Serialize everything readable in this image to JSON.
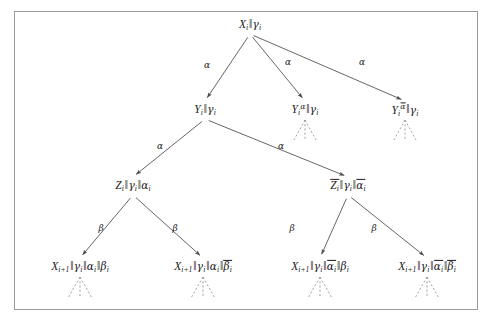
{
  "figure": {
    "kind": "binary-derivation-tree",
    "border_color": "#9a9a9a",
    "line_color": "#4a4a4a",
    "text_color": "#1a1a1a",
    "background": "#ffffff"
  },
  "nodes": {
    "root": {
      "id": "root",
      "label": "X_i || gamma_i",
      "x": 250,
      "y": 25,
      "parts": [
        {
          "t": "var",
          "v": "X",
          "sub": "i"
        },
        {
          "t": "par"
        },
        {
          "t": "greek",
          "v": "γ",
          "sub": "i"
        }
      ]
    },
    "y_plain": {
      "id": "y-plain",
      "label": "Y_i || gamma_i",
      "x": 205,
      "y": 110,
      "parts": [
        {
          "t": "var",
          "v": "Y",
          "sub": "i"
        },
        {
          "t": "par"
        },
        {
          "t": "greek",
          "v": "γ",
          "sub": "i"
        }
      ]
    },
    "y_alpha": {
      "id": "y-alpha",
      "label": "Y_i^alpha || gamma_i",
      "x": 305,
      "y": 110,
      "sup": "α",
      "sup_bar": false,
      "parts": [
        {
          "t": "var",
          "v": "Y",
          "sub": "i",
          "sup": "α"
        },
        {
          "t": "par"
        },
        {
          "t": "greek",
          "v": "γ",
          "sub": "i"
        }
      ]
    },
    "y_alpha_bar": {
      "id": "y-alpha-bar",
      "label": "Y_i^alphabar || gamma_i",
      "x": 405,
      "y": 110,
      "sup": "α",
      "sup_bar": true,
      "parts": [
        {
          "t": "var",
          "v": "Y",
          "sub": "i",
          "sup": "α",
          "sup_bar": true
        },
        {
          "t": "par"
        },
        {
          "t": "greek",
          "v": "γ",
          "sub": "i"
        }
      ]
    },
    "z_plain": {
      "id": "z-plain",
      "label": "Z_i || gamma_i || alpha_i",
      "x": 133,
      "y": 186,
      "parts": [
        {
          "t": "var",
          "v": "Z",
          "sub": "i"
        },
        {
          "t": "par"
        },
        {
          "t": "greek",
          "v": "γ",
          "sub": "i"
        },
        {
          "t": "par"
        },
        {
          "t": "greek",
          "v": "α",
          "sub": "i"
        }
      ]
    },
    "z_bar": {
      "id": "z-bar",
      "label": "Zbar_i || gamma_i || alphabar_i",
      "x": 348,
      "y": 186,
      "parts": [
        {
          "t": "var",
          "v": "Z",
          "sub": "i",
          "bar": true
        },
        {
          "t": "par"
        },
        {
          "t": "greek",
          "v": "γ",
          "sub": "i"
        },
        {
          "t": "par"
        },
        {
          "t": "greek",
          "v": "α",
          "sub": "i",
          "bar": true
        }
      ]
    },
    "leaf1": {
      "id": "leaf-aa-bb",
      "label": "X_{i+1} || gamma_i || alpha_i || beta_i",
      "x": 80,
      "y": 267,
      "parts": [
        {
          "t": "var",
          "v": "X",
          "sub": "i+1"
        },
        {
          "t": "par"
        },
        {
          "t": "greek",
          "v": "γ",
          "sub": "i"
        },
        {
          "t": "par"
        },
        {
          "t": "greek",
          "v": "α",
          "sub": "i"
        },
        {
          "t": "par"
        },
        {
          "t": "greek",
          "v": "β",
          "sub": "i"
        }
      ]
    },
    "leaf2": {
      "id": "leaf-aa-bbbar",
      "label": "X_{i+1} || gamma_i || alpha_i || betabar_i",
      "x": 203,
      "y": 267,
      "parts": [
        {
          "t": "var",
          "v": "X",
          "sub": "i+1"
        },
        {
          "t": "par"
        },
        {
          "t": "greek",
          "v": "γ",
          "sub": "i"
        },
        {
          "t": "par"
        },
        {
          "t": "greek",
          "v": "α",
          "sub": "i"
        },
        {
          "t": "par"
        },
        {
          "t": "greek",
          "v": "β",
          "sub": "i",
          "bar": true
        }
      ]
    },
    "leaf3": {
      "id": "leaf-aabar-bb",
      "label": "X_{i+1} || gamma_i || alphabar_i || beta_i",
      "x": 320,
      "y": 267,
      "parts": [
        {
          "t": "var",
          "v": "X",
          "sub": "i+1"
        },
        {
          "t": "par"
        },
        {
          "t": "greek",
          "v": "γ",
          "sub": "i"
        },
        {
          "t": "par"
        },
        {
          "t": "greek",
          "v": "α",
          "sub": "i",
          "bar": true
        },
        {
          "t": "par"
        },
        {
          "t": "greek",
          "v": "β",
          "sub": "i"
        }
      ]
    },
    "leaf4": {
      "id": "leaf-aabar-bbbar",
      "label": "X_{i+1} || gamma_i || alphabar_i || betabar_i",
      "x": 427,
      "y": 267,
      "parts": [
        {
          "t": "var",
          "v": "X",
          "sub": "i+1"
        },
        {
          "t": "par"
        },
        {
          "t": "greek",
          "v": "γ",
          "sub": "i"
        },
        {
          "t": "par"
        },
        {
          "t": "greek",
          "v": "α",
          "sub": "i",
          "bar": true
        },
        {
          "t": "par"
        },
        {
          "t": "greek",
          "v": "β",
          "sub": "i",
          "bar": true
        }
      ]
    }
  },
  "edge_labels": [
    {
      "id": "edge-label-root-left",
      "text": "α",
      "x": 207,
      "y": 65
    },
    {
      "id": "edge-label-root-mid",
      "text": "α",
      "x": 288,
      "y": 62
    },
    {
      "id": "edge-label-root-right",
      "text": "α",
      "x": 362,
      "y": 62
    },
    {
      "id": "edge-label-y-left",
      "text": "α",
      "x": 160,
      "y": 146
    },
    {
      "id": "edge-label-y-right",
      "text": "α",
      "x": 281,
      "y": 146
    },
    {
      "id": "edge-label-z-left",
      "text": "β",
      "x": 101,
      "y": 228
    },
    {
      "id": "edge-label-z-right",
      "text": "β",
      "x": 175,
      "y": 228
    },
    {
      "id": "edge-label-zbar-left",
      "text": "β",
      "x": 292,
      "y": 228
    },
    {
      "id": "edge-label-zbar-right",
      "text": "β",
      "x": 374,
      "y": 228
    }
  ],
  "edges": [
    {
      "id": "edge-root-to-y-plain",
      "from": "root",
      "to": "y_plain",
      "style": "solid",
      "arrow": true
    },
    {
      "id": "edge-root-to-y-alpha",
      "from": "root",
      "to": "y_alpha",
      "style": "solid",
      "arrow": true
    },
    {
      "id": "edge-root-to-y-alpha-bar",
      "from": "root",
      "to": "y_alpha_bar",
      "style": "solid",
      "arrow": true
    },
    {
      "id": "edge-y-to-z-plain",
      "from": "y_plain",
      "to": "z_plain",
      "style": "solid",
      "arrow": true
    },
    {
      "id": "edge-y-to-z-bar",
      "from": "y_plain",
      "to": "z_bar",
      "style": "solid",
      "arrow": true
    },
    {
      "id": "edge-z-to-leaf1",
      "from": "z_plain",
      "to": "leaf1",
      "style": "solid",
      "arrow": true
    },
    {
      "id": "edge-z-to-leaf2",
      "from": "z_plain",
      "to": "leaf2",
      "style": "solid",
      "arrow": true
    },
    {
      "id": "edge-zbar-to-leaf3",
      "from": "z_bar",
      "to": "leaf3",
      "style": "solid",
      "arrow": true
    },
    {
      "id": "edge-zbar-to-leaf4",
      "from": "z_bar",
      "to": "leaf4",
      "style": "solid",
      "arrow": true
    }
  ],
  "elided_subtrees": [
    {
      "id": "elision-y-alpha",
      "under": "y_alpha",
      "x": 305,
      "y": 120,
      "spread": 22,
      "depth": 20
    },
    {
      "id": "elision-y-alpha-bar",
      "under": "y_alpha_bar",
      "x": 405,
      "y": 120,
      "spread": 22,
      "depth": 20
    },
    {
      "id": "elision-leaf1",
      "under": "leaf1",
      "x": 80,
      "y": 277,
      "spread": 24,
      "depth": 21
    },
    {
      "id": "elision-leaf2",
      "under": "leaf2",
      "x": 203,
      "y": 277,
      "spread": 24,
      "depth": 21
    },
    {
      "id": "elision-leaf3",
      "under": "leaf3",
      "x": 320,
      "y": 277,
      "spread": 24,
      "depth": 21
    },
    {
      "id": "elision-leaf4",
      "under": "leaf4",
      "x": 427,
      "y": 277,
      "spread": 24,
      "depth": 21
    }
  ]
}
